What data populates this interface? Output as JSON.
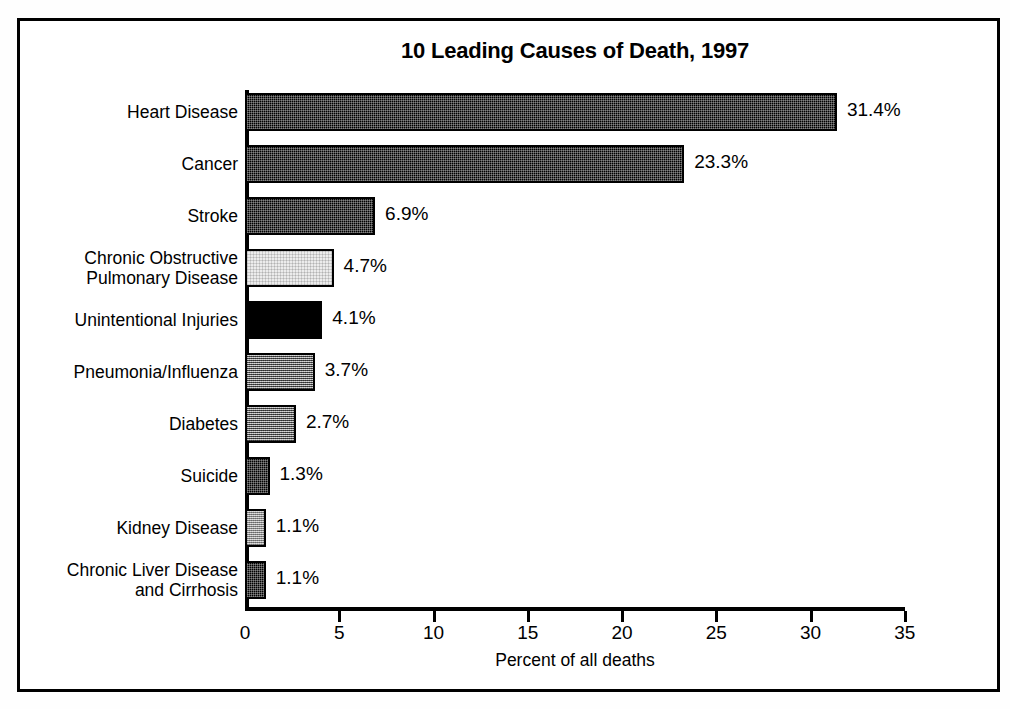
{
  "chart_data": {
    "type": "bar",
    "orientation": "horizontal",
    "title": "10 Leading Causes of Death, 1997",
    "xlabel": "Percent of all deaths",
    "ylabel": "",
    "xlim": [
      0,
      35
    ],
    "xticks": [
      0,
      5,
      10,
      15,
      20,
      25,
      30,
      35
    ],
    "grid": false,
    "legend": false,
    "categories": [
      "Heart Disease",
      "Cancer",
      "Stroke",
      "Chronic Obstructive\nPulmonary Disease",
      "Unintentional Injuries",
      "Pneumonia/Influenza",
      "Diabetes",
      "Suicide",
      "Kidney Disease",
      "Chronic Liver Disease\nand Cirrhosis"
    ],
    "values": [
      31.4,
      23.3,
      6.9,
      4.7,
      4.1,
      3.7,
      2.7,
      1.3,
      1.1,
      1.1
    ],
    "value_labels": [
      "31.4%",
      "23.3%",
      "6.9%",
      "4.7%",
      "4.1%",
      "3.7%",
      "2.7%",
      "1.3%",
      "1.1%",
      "1.1%"
    ],
    "bar_fills": [
      "dark",
      "dark",
      "dark",
      "light",
      "black",
      "mid",
      "mid",
      "dark",
      "litemid",
      "dark"
    ],
    "bars": [
      {
        "label": "Heart Disease",
        "value": 31.4,
        "value_label": "31.4%",
        "fill": "dark"
      },
      {
        "label": "Cancer",
        "value": 23.3,
        "value_label": "23.3%",
        "fill": "dark"
      },
      {
        "label": "Stroke",
        "value": 6.9,
        "value_label": "6.9%",
        "fill": "dark"
      },
      {
        "label": "Chronic Obstructive\nPulmonary Disease",
        "value": 4.7,
        "value_label": "4.7%",
        "fill": "light"
      },
      {
        "label": "Unintentional Injuries",
        "value": 4.1,
        "value_label": "4.1%",
        "fill": "black"
      },
      {
        "label": "Pneumonia/Influenza",
        "value": 3.7,
        "value_label": "3.7%",
        "fill": "mid"
      },
      {
        "label": "Diabetes",
        "value": 2.7,
        "value_label": "2.7%",
        "fill": "mid"
      },
      {
        "label": "Suicide",
        "value": 1.3,
        "value_label": "1.3%",
        "fill": "dark"
      },
      {
        "label": "Kidney Disease",
        "value": 1.1,
        "value_label": "1.1%",
        "fill": "litemid"
      },
      {
        "label": "Chronic Liver Disease\nand Cirrhosis",
        "value": 1.1,
        "value_label": "1.1%",
        "fill": "dark"
      }
    ],
    "colors": {
      "axis": "#000000",
      "text": "#000000",
      "background": "#ffffff",
      "frame": "#000000"
    }
  }
}
